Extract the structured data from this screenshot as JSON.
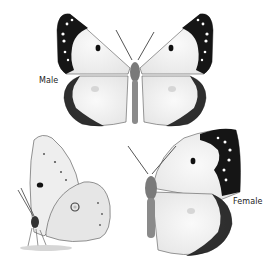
{
  "illustration": {
    "subject": "butterfly",
    "views": [
      {
        "id": "male-dorsal",
        "label": "Male"
      },
      {
        "id": "side-view",
        "label": ""
      },
      {
        "id": "female-dorsal",
        "label": "Female"
      }
    ]
  },
  "labels": {
    "male": "Male",
    "female": "Female"
  },
  "colors": {
    "background": "#ffffff",
    "wing": "#f2f2f2",
    "wing_border": "#111111",
    "body": "#6e6e6e"
  }
}
